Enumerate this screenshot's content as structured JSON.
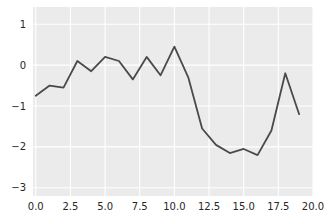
{
  "figure": {
    "background": "#ffffff"
  },
  "chart_data": {
    "type": "line",
    "title": "",
    "xlabel": "",
    "ylabel": "",
    "x": [
      0,
      1,
      2,
      3,
      4,
      5,
      6,
      7,
      8,
      9,
      10,
      11,
      12,
      13,
      14,
      15,
      16,
      17,
      18,
      19
    ],
    "series": [
      {
        "name": "series-1",
        "color": "#4a4a4a",
        "line_width": 1.8,
        "values": [
          -0.75,
          -0.5,
          -0.55,
          0.1,
          -0.15,
          0.2,
          0.1,
          -0.35,
          0.2,
          -0.25,
          0.45,
          -0.3,
          -1.55,
          -1.95,
          -2.15,
          -2.05,
          -2.2,
          -1.6,
          -0.2,
          -1.2
        ]
      }
    ],
    "xlim": [
      -0.2,
      20.0
    ],
    "ylim": [
      -3.2,
      1.42
    ],
    "x_ticks": {
      "values": [
        0,
        2.5,
        5,
        7.5,
        10,
        12.5,
        15,
        17.5,
        20
      ],
      "labels": [
        "0.0",
        "2.5",
        "5.0",
        "7.5",
        "10.0",
        "12.5",
        "15.0",
        "17.5",
        "20.0"
      ]
    },
    "y_ticks": {
      "values": [
        1,
        0,
        -1,
        -2,
        -3
      ],
      "labels": [
        "1",
        "0",
        "−1",
        "−2",
        "−3"
      ]
    },
    "grid": true,
    "legend": null,
    "style": {
      "plot_background": "#ebebeb",
      "grid_color": "#ffffff",
      "tick_label_color": "#262626",
      "tick_font_size": 10
    }
  }
}
